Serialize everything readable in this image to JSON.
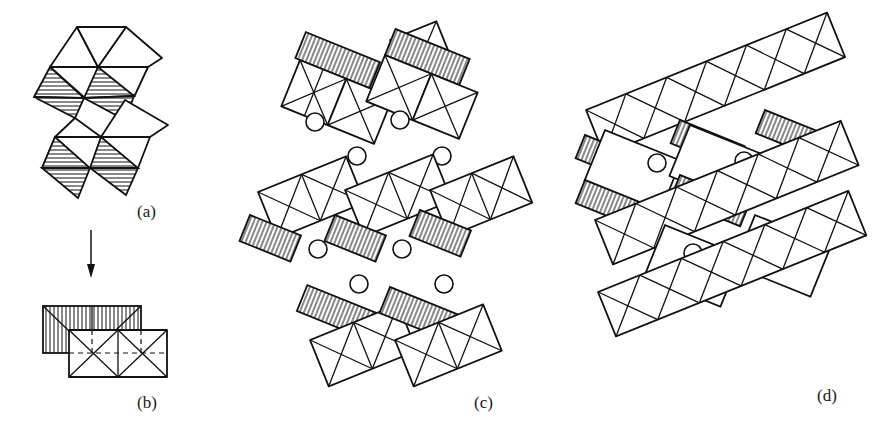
{
  "figure": {
    "panels": [
      {
        "id": "a",
        "label": "(a)",
        "description": "Stack of edge-sharing octahedra, shaded lower faces"
      },
      {
        "id": "b",
        "label": "(b)",
        "description": "Projection of octahedra pair viewed along arrow"
      },
      {
        "id": "c",
        "label": "(c)",
        "description": "Layers of octahedra separated by interlayer cations (circles)"
      },
      {
        "id": "d",
        "label": "(d)",
        "description": "Framework of octahedra with cations in tunnels"
      }
    ],
    "arrow": {
      "direction": "down",
      "from": "(a)",
      "to": "(b)"
    },
    "colors": {
      "line": "#111111",
      "background": "#ffffff"
    }
  }
}
